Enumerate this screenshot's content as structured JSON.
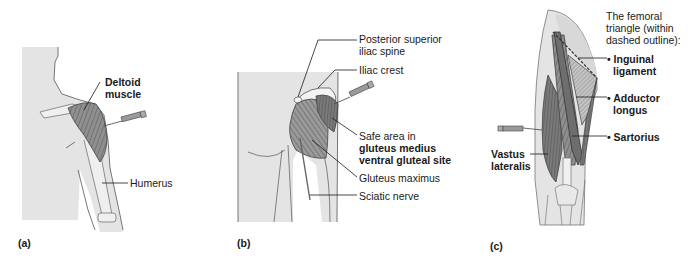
{
  "figure": {
    "panels": [
      {
        "id": "a",
        "letter": "(a)",
        "labels": {
          "deltoid_1": "Deltoid",
          "deltoid_2": "muscle",
          "humerus": "Humerus"
        }
      },
      {
        "id": "b",
        "letter": "(b)",
        "labels": {
          "psis_1": "Posterior superior",
          "psis_2": "iliac spine",
          "iliac_crest": "Iliac crest",
          "safe_1": "Safe area in",
          "safe_2": "gluteus medius",
          "safe_3": "ventral gluteal site",
          "gluteus_maximus": "Gluteus maximus",
          "sciatic_nerve": "Sciatic nerve"
        }
      },
      {
        "id": "c",
        "letter": "(c)",
        "labels": {
          "title_1": "The femoral",
          "title_2": "triangle (within",
          "title_3": "dashed outline):",
          "inguinal_1": "• Inguinal",
          "inguinal_2": "ligament",
          "adductor_1": "• Adductor",
          "adductor_2": "longus",
          "sartorius": "• Sartorius",
          "vastus_1": "Vastus",
          "vastus_2": "lateralis"
        }
      }
    ],
    "colors": {
      "skin": "#e4e4e4",
      "outline": "#555555",
      "muscle": "#8a8a8a",
      "muscle_dark": "#6e6e6e",
      "muscle_light": "#bdbdbd",
      "bone": "#f2f2f2",
      "leader": "#1a1a1a",
      "text": "#1a1a1a"
    }
  }
}
